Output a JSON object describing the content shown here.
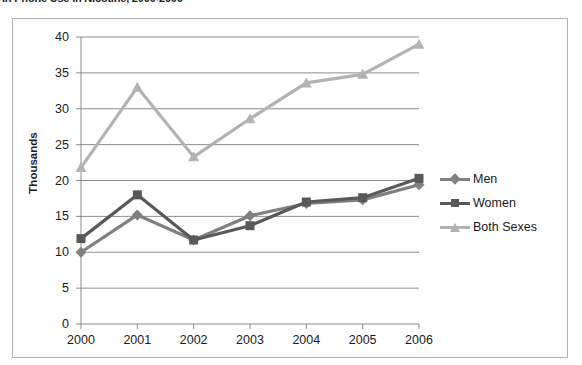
{
  "title": "in Phone Use in Nicotine, 2000-2006",
  "legend": {
    "position": "right",
    "items": [
      {
        "label": "Men",
        "color": "#808080",
        "marker": "diamond"
      },
      {
        "label": "Women",
        "color": "#595959",
        "marker": "square"
      },
      {
        "label": "Both Sexes",
        "color": "#b3b3b3",
        "marker": "triangle"
      }
    ]
  },
  "axis": {
    "ylabel": "Thousands",
    "yticks": [
      "0",
      "5",
      "10",
      "15",
      "20",
      "25",
      "30",
      "35",
      "40"
    ],
    "xticks": [
      "2000",
      "2001",
      "2002",
      "2003",
      "2004",
      "2005",
      "2006"
    ]
  },
  "chart_data": {
    "type": "line",
    "title": "in Phone Use in Nicotine, 2000-2006",
    "xlabel": "",
    "ylabel": "Thousands",
    "categories": [
      "2000",
      "2001",
      "2002",
      "2003",
      "2004",
      "2005",
      "2006"
    ],
    "ylim": [
      0,
      40
    ],
    "ytick_step": 5,
    "grid": true,
    "legend_position": "right",
    "series": [
      {
        "name": "Men",
        "color": "#808080",
        "marker": "diamond",
        "values": [
          10.0,
          15.2,
          11.7,
          15.1,
          16.8,
          17.3,
          19.4
        ]
      },
      {
        "name": "Women",
        "color": "#595959",
        "marker": "square",
        "values": [
          11.9,
          18.0,
          11.7,
          13.7,
          17.0,
          17.6,
          20.3
        ]
      },
      {
        "name": "Both Sexes",
        "color": "#b3b3b3",
        "marker": "triangle",
        "values": [
          21.8,
          33.0,
          23.3,
          28.6,
          33.6,
          34.8,
          39.0
        ]
      }
    ]
  }
}
